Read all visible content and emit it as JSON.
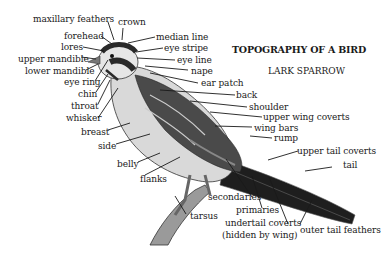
{
  "title": "TOPOGRAPHY OF A BIRD",
  "subtitle": "LARK SPARROW",
  "colors": {
    "ink": "#1a1a1a",
    "background": "#ffffff",
    "plumage_dark": "#2b2b2b",
    "plumage_mid": "#8a8a8a",
    "plumage_light": "#d8d8d8"
  },
  "labels": {
    "maxillary_feathers": "maxillary feathers",
    "crown": "crown",
    "forehead": "forehead",
    "median_line": "median line",
    "lores": "lores",
    "eye_stripe": "eye stripe",
    "upper_mandible": "upper mandible",
    "eye_line": "eye line",
    "lower_mandible": "lower mandible",
    "nape": "nape",
    "eye_ring": "eye ring",
    "ear_patch": "ear patch",
    "chin": "chin",
    "back": "back",
    "throat": "throat",
    "shoulder": "shoulder",
    "whisker": "whisker",
    "upper_wing_coverts": "upper wing coverts",
    "breast": "breast",
    "wing_bars": "wing bars",
    "side": "side",
    "rump": "rump",
    "upper_tail_coverts": "upper tail coverts",
    "belly": "belly",
    "tail": "tail",
    "flanks": "flanks",
    "secondaries": "secondaries",
    "tarsus": "tarsus",
    "primaries": "primaries",
    "undertail_coverts": "undertail coverts",
    "hidden_by_wing": "(hidden by wing)",
    "outer_tail_feathers": "outer tail feathers"
  }
}
